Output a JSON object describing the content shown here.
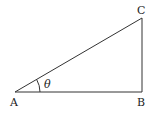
{
  "diagram": {
    "type": "right-triangle",
    "vertices": {
      "A": {
        "label": "A"
      },
      "B": {
        "label": "B"
      },
      "C": {
        "label": "C"
      }
    },
    "angle": {
      "vertex": "A",
      "label": "θ"
    },
    "right_angle_at": "B",
    "edges": [
      "AB",
      "BC",
      "CA"
    ]
  }
}
